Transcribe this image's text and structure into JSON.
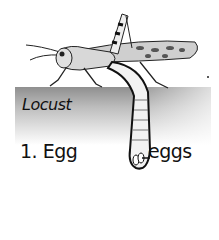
{
  "image": {
    "subject": "Locust laying eggs in soil",
    "labels": {
      "title": "Locust",
      "stage": "1. Egg",
      "pointer": "eggs"
    }
  }
}
